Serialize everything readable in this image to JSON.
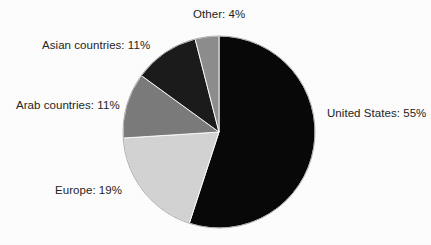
{
  "chart_data": {
    "type": "pie",
    "title": "",
    "labels": [
      "United States",
      "Europe",
      "Arab countries",
      "Asian countries",
      "Other"
    ],
    "values": [
      55,
      19,
      11,
      11,
      4
    ],
    "value_suffix": "%",
    "legend": "none",
    "start_angle_deg": 0,
    "direction": "clockwise",
    "colors": [
      "#080808",
      "#d3d3d3",
      "#7b7b7b",
      "#1b1b1b",
      "#8d8d8d"
    ],
    "annotations": [
      {
        "label": "United States: 55%"
      },
      {
        "label": "Europe: 19%"
      },
      {
        "label": "Arab countries: 11%"
      },
      {
        "label": "Asian countries: 11%"
      },
      {
        "label": "Other: 4%"
      }
    ]
  },
  "labels": {
    "other": "Other: 4%",
    "asian": "Asian countries: 11%",
    "arab": "Arab countries: 11%",
    "europe": "Europe: 19%",
    "united_states": "United States: 55%"
  }
}
